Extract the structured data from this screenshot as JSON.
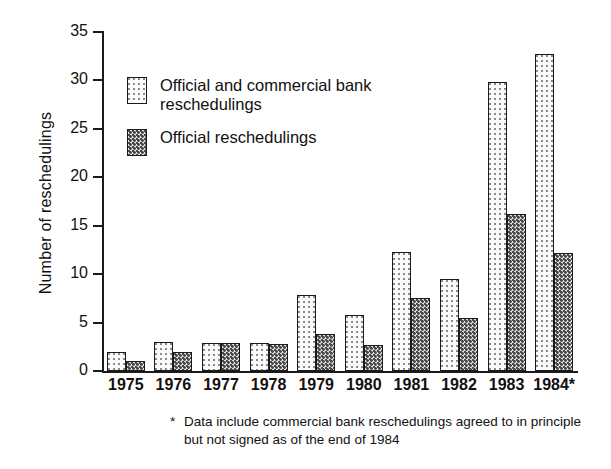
{
  "chart_data": {
    "type": "bar",
    "title": "",
    "xlabel": "",
    "ylabel": "Number of reschedulings",
    "ylim": [
      0,
      35
    ],
    "ytick_step": 5,
    "yticks": [
      0,
      5,
      10,
      15,
      20,
      25,
      30,
      35
    ],
    "grid": false,
    "legend_position": "upper-left-inside",
    "categories": [
      "1975",
      "1976",
      "1977",
      "1978",
      "1979",
      "1980",
      "1981",
      "1982",
      "1983",
      "1984*"
    ],
    "series": [
      {
        "name": "Official and commercial bank reschedulings",
        "pattern": "light-dotted",
        "values": [
          2.0,
          3.0,
          2.9,
          2.9,
          7.8,
          5.8,
          12.3,
          9.5,
          29.8,
          32.7
        ]
      },
      {
        "name": "Official reschedulings",
        "pattern": "dark-dotted",
        "values": [
          1.0,
          2.0,
          2.9,
          2.8,
          3.8,
          2.7,
          7.5,
          5.5,
          16.2,
          12.2
        ]
      }
    ],
    "annotations": [
      "* Data include commercial bank reschedulings agreed to in principle but not signed as of the end of 1984"
    ]
  },
  "axis": {
    "y_title": "Number of reschedulings",
    "y_tick_labels": [
      "35",
      "30",
      "25",
      "20",
      "15",
      "10",
      "5",
      "0"
    ],
    "x_tick_labels": [
      "1975",
      "1976",
      "1977",
      "1978",
      "1979",
      "1980",
      "1981",
      "1982",
      "1983",
      "1984*"
    ]
  },
  "legend": {
    "entries": [
      {
        "label": "Official and commercial bank reschedulings"
      },
      {
        "label": "Official reschedulings"
      }
    ]
  },
  "footnote": {
    "marker": "*",
    "text": "Data include commercial bank reschedulings agreed to in principle but not signed as of the end of 1984"
  },
  "colors": {
    "axis": "#1a1a1a",
    "text": "#111111",
    "background": "#ffffff",
    "series_light_fill": "#fbfbfb",
    "series_light_dots": "#8a8a8a",
    "series_dark_fill": "#e2e2e2",
    "series_dark_dots": "#4a4a4a"
  }
}
